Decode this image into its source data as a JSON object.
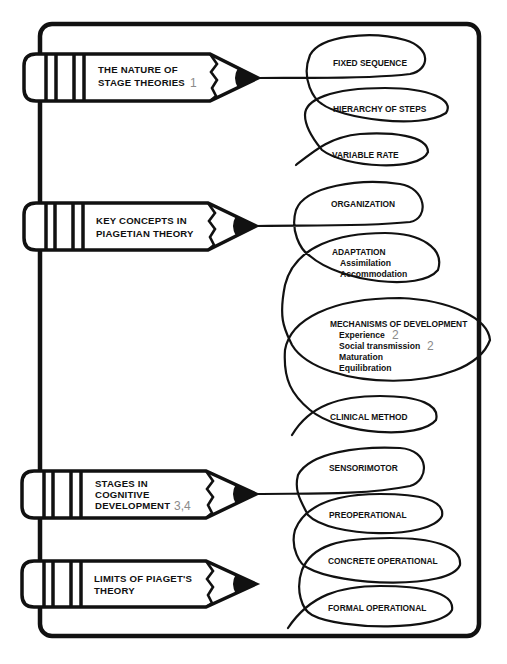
{
  "colors": {
    "ink": "#111111",
    "reference_number": "#8a8a8a",
    "background": "#ffffff"
  },
  "sections": [
    {
      "title_lines": [
        "THE NATURE OF",
        "STAGE THEORIES"
      ],
      "reference": "1",
      "items": [
        {
          "label": "FIXED SEQUENCE",
          "sub": []
        },
        {
          "label": "HIERARCHY OF STEPS",
          "sub": []
        },
        {
          "label": "VARIABLE RATE",
          "sub": []
        }
      ]
    },
    {
      "title_lines": [
        "KEY CONCEPTS IN",
        "PIAGETIAN THEORY"
      ],
      "reference": "",
      "items": [
        {
          "label": "ORGANIZATION",
          "sub": []
        },
        {
          "label": "ADAPTATION",
          "sub": [
            {
              "text": "Assimilation",
              "ref": ""
            },
            {
              "text": "Accommodation",
              "ref": ""
            }
          ]
        },
        {
          "label": "MECHANISMS OF DEVELOPMENT",
          "sub": [
            {
              "text": "Experience",
              "ref": "2"
            },
            {
              "text": "Social transmission",
              "ref": "2"
            },
            {
              "text": "Maturation",
              "ref": ""
            },
            {
              "text": "Equilibration",
              "ref": ""
            }
          ]
        },
        {
          "label": "CLINICAL METHOD",
          "sub": []
        }
      ]
    },
    {
      "title_lines": [
        "STAGES IN",
        "COGNITIVE",
        "DEVELOPMENT"
      ],
      "reference": "3,4",
      "items": [
        {
          "label": "SENSORIMOTOR",
          "sub": []
        },
        {
          "label": "PREOPERATIONAL",
          "sub": []
        },
        {
          "label": "CONCRETE OPERATIONAL",
          "sub": []
        },
        {
          "label": "FORMAL OPERATIONAL",
          "sub": []
        }
      ]
    },
    {
      "title_lines": [
        "LIMITS OF PIAGET'S",
        "THEORY"
      ],
      "reference": "",
      "items": []
    }
  ]
}
